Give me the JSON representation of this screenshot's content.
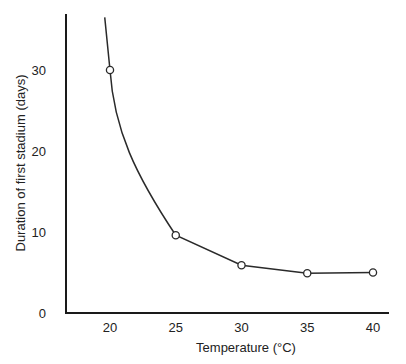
{
  "chart_data": {
    "type": "line",
    "title": "",
    "xlabel": "Temperature (°C)",
    "ylabel": "Duration of first stadium (days)",
    "x": [
      20,
      25,
      30,
      35,
      40
    ],
    "series": [
      {
        "name": "Duration of first stadium",
        "values": [
          30,
          9.6,
          5.9,
          4.9,
          5.0
        ],
        "marker": "open-circle"
      }
    ],
    "curve_extends_above": {
      "x": 19.6,
      "y": 36.5
    },
    "xticks": [
      "20",
      "25",
      "30",
      "35",
      "40"
    ],
    "yticks": [
      "0",
      "10",
      "20",
      "30"
    ],
    "xlim": [
      16.5,
      41.5
    ],
    "ylim": [
      0,
      37
    ],
    "grid": false,
    "legend": null
  },
  "colors": {
    "axis": "#1a1a1a",
    "line": "#2a2a2a",
    "marker_fill": "#ffffff",
    "text": "#222222"
  }
}
